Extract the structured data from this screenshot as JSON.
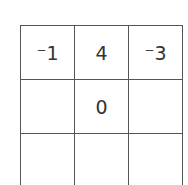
{
  "grid": {
    "rows": [
      [
        "⁻1",
        "4",
        "⁻3"
      ],
      [
        "",
        "0",
        ""
      ],
      [
        "",
        "",
        ""
      ]
    ]
  }
}
